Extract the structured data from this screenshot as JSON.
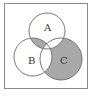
{
  "diagram": {
    "type": "venn",
    "sets": [
      {
        "name": "A",
        "cx": 47,
        "cy": 31,
        "r": 18
      },
      {
        "name": "B",
        "cx": 33,
        "cy": 57,
        "r": 19
      },
      {
        "name": "C",
        "cx": 61,
        "cy": 59,
        "r": 21
      }
    ],
    "labels": {
      "A": "A",
      "B": "B",
      "C": "C"
    },
    "shaded_regions": [
      "A∩B only",
      "C only"
    ],
    "colors": {
      "shade": "#a9a9a9",
      "stroke": "#6a6a6a",
      "frame": "#8a8a8a",
      "background": "#ffffff"
    },
    "caption": ""
  }
}
